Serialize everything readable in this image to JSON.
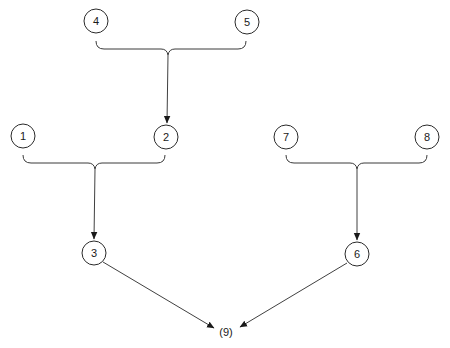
{
  "diagram": {
    "type": "tree-merge",
    "nodes": [
      {
        "id": "4",
        "label": "4",
        "x": 96,
        "y": 21
      },
      {
        "id": "5",
        "label": "5",
        "x": 247,
        "y": 22
      },
      {
        "id": "1",
        "label": "1",
        "x": 23,
        "y": 136
      },
      {
        "id": "2",
        "label": "2",
        "x": 166,
        "y": 137
      },
      {
        "id": "7",
        "label": "7",
        "x": 286,
        "y": 137
      },
      {
        "id": "8",
        "label": "8",
        "x": 427,
        "y": 137
      },
      {
        "id": "3",
        "label": "3",
        "x": 94,
        "y": 253
      },
      {
        "id": "6",
        "label": "6",
        "x": 357,
        "y": 254
      }
    ],
    "merges": [
      {
        "inputs": [
          "4",
          "5"
        ],
        "output": "2"
      },
      {
        "inputs": [
          "1",
          "2"
        ],
        "output": "3"
      },
      {
        "inputs": [
          "7",
          "8"
        ],
        "output": "6"
      }
    ],
    "final": {
      "label": "(9)",
      "inputs": [
        "3",
        "6"
      ],
      "x": 226,
      "y": 332
    }
  }
}
